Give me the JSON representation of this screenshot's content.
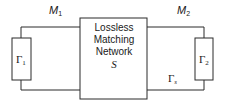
{
  "diagram": {
    "left_port": {
      "label": "M",
      "subscript": "1"
    },
    "right_port": {
      "label": "M",
      "subscript": "2"
    },
    "left_load": {
      "symbol": "Γ",
      "subscript": "1"
    },
    "right_load": {
      "symbol": "Γ",
      "subscript": "2"
    },
    "source_reflection": {
      "symbol": "Γ",
      "subscript": "s"
    },
    "network": {
      "lines": [
        "Lossless",
        "Matching",
        "Network"
      ],
      "symbol": "S"
    },
    "colors": {
      "stroke": "#2b2b2b",
      "text": "#1a1a1a",
      "background": "#ffffff"
    }
  }
}
